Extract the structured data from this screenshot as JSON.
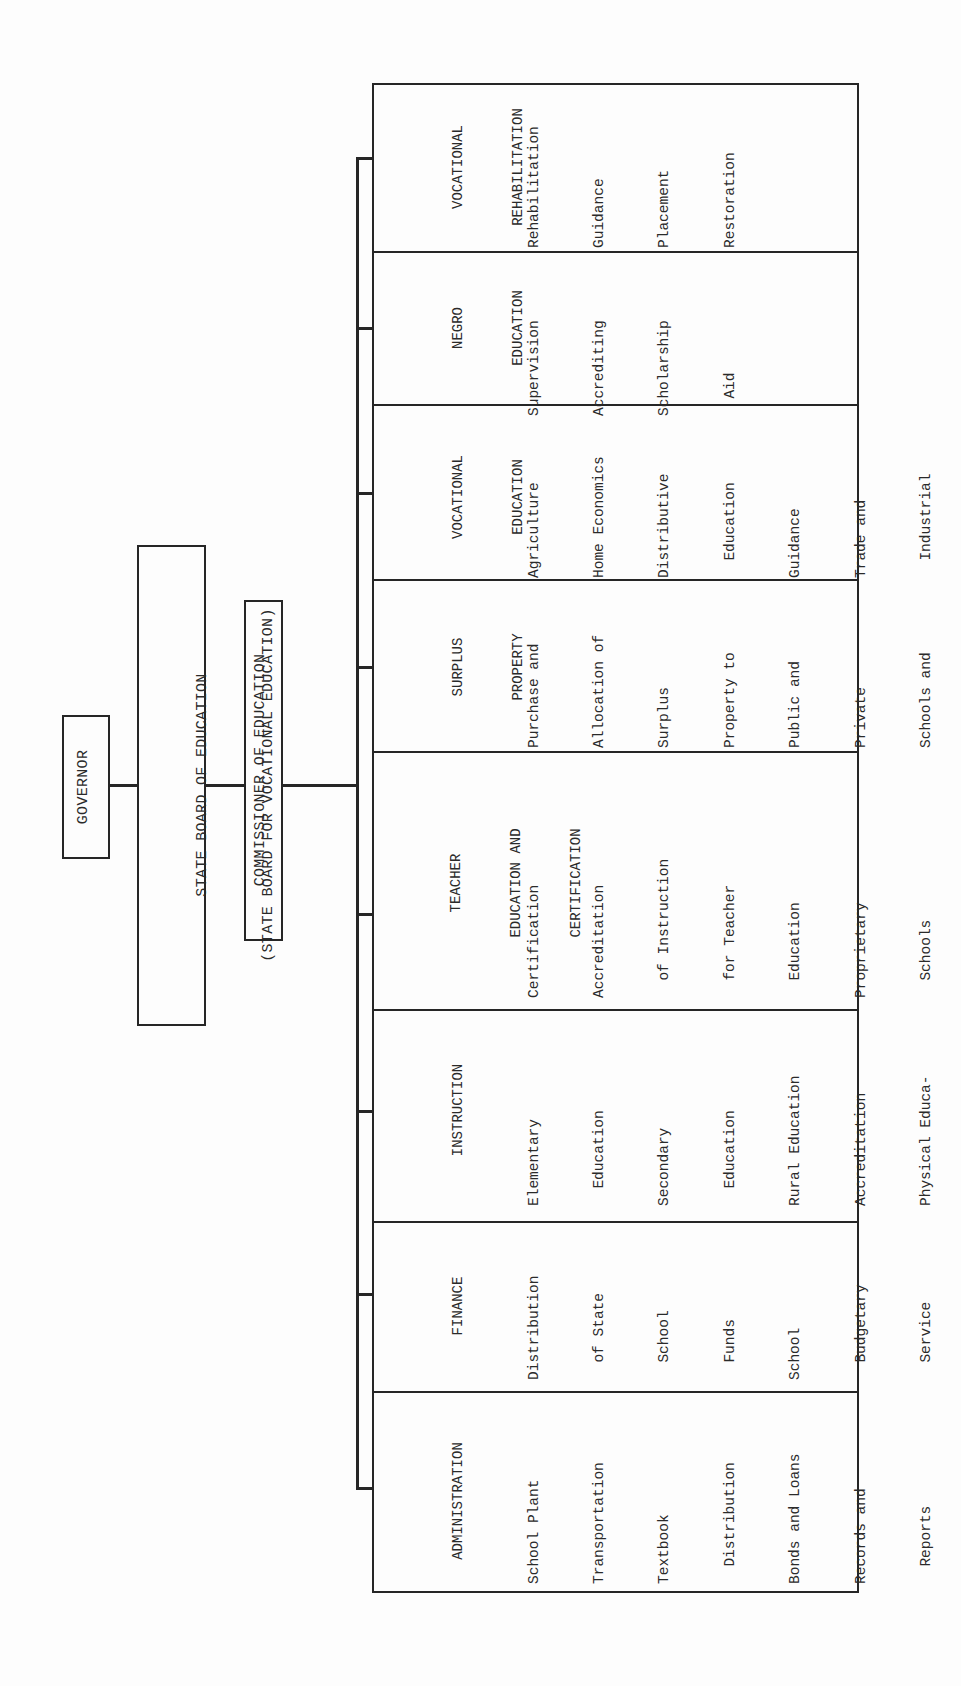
{
  "chart": {
    "orientation": "rotated-90-ccw",
    "hierarchy": {
      "governor": "GOVERNOR",
      "state_board": {
        "line1": "STATE BOARD OF EDUCATION",
        "line2": "(STATE BOARD FOR VOCATIONAL EDUCATION)"
      },
      "commissioner": "COMMISSIONER OF EDUCATION"
    },
    "divisions": [
      {
        "header": [
          "ADMINISTRATION"
        ],
        "items": [
          "School Plant",
          "Transportation",
          "Textbook",
          "  Distribution",
          "Bonds and Loans",
          "Records and",
          "  Reports",
          "School Law",
          "School Unit",
          "  Organization",
          "School Census"
        ]
      },
      {
        "header": [
          "FINANCE"
        ],
        "items": [
          "Distribution",
          "  of State",
          "  School",
          "  Funds",
          "School",
          "  Budgetary",
          "  Service"
        ]
      },
      {
        "header": [
          "INSTRUCTION"
        ],
        "items": [
          "Elementary",
          "  Education",
          "Secondary",
          "  Education",
          "Rural Education",
          "Accreditation",
          "Physical Educa-",
          "  tion",
          "Health and",
          "  Safety",
          "  Education",
          "Audiovisual",
          "  Education",
          "Special",
          "  Education"
        ]
      },
      {
        "header": [
          "TEACHER",
          "EDUCATION AND",
          "CERTIFICATION"
        ],
        "items": [
          "Certification",
          "Accreditation",
          "  of Instruction",
          "  for Teacher",
          "  Education",
          "Proprietary",
          "  Schools",
          "Approval for",
          "  Veterans",
          "  Training"
        ]
      },
      {
        "header": [
          "SURPLUS",
          "PROPERTY"
        ],
        "items": [
          "Purchase and",
          "Allocation of",
          "Surplus",
          "Property to",
          "Public and",
          "Private",
          "Schools and",
          "Colleges"
        ]
      },
      {
        "header": [
          "VOCATIONAL",
          "EDUCATION"
        ],
        "items": [
          "Agriculture",
          "Home Economics",
          "Distributive",
          "  Education",
          "Guidance",
          "Trade and",
          "  Industrial",
          "  Education",
          "School Lunch",
          "Veterans On-",
          "  the-Job",
          "  Training"
        ]
      },
      {
        "header": [
          "NEGRO",
          "EDUCATION"
        ],
        "items": [
          "Supervision",
          "Accrediting",
          "Scholarship",
          "  Aid"
        ]
      },
      {
        "header": [
          "VOCATIONAL",
          "REHABILITATION"
        ],
        "items": [
          "Rehabilitation",
          "Guidance",
          "Placement",
          "Restoration"
        ]
      }
    ]
  },
  "colors": {
    "ink": "#262626",
    "paper": "#fdfdfd"
  }
}
